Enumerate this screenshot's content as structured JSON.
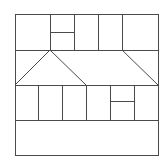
{
  "diagram": {
    "title": "",
    "stroke_color": "#4a4a4a",
    "background": "#ffffff",
    "outer_box": {
      "x": 15,
      "y": 14,
      "width": 143,
      "height": 141
    },
    "horizontal_lines": [
      {
        "x1": 15,
        "y1": 50,
        "x2": 158,
        "y2": 50
      },
      {
        "x1": 15,
        "y1": 85,
        "x2": 158,
        "y2": 85
      },
      {
        "x1": 15,
        "y1": 120,
        "x2": 158,
        "y2": 120
      },
      {
        "x1": 50,
        "y1": 32,
        "x2": 74,
        "y2": 32
      },
      {
        "x1": 110,
        "y1": 101,
        "x2": 134,
        "y2": 101
      }
    ],
    "vertical_lines": [
      {
        "x1": 50,
        "y1": 14,
        "x2": 50,
        "y2": 50
      },
      {
        "x1": 74,
        "y1": 14,
        "x2": 74,
        "y2": 50
      },
      {
        "x1": 98,
        "y1": 14,
        "x2": 98,
        "y2": 50
      },
      {
        "x1": 122,
        "y1": 14,
        "x2": 122,
        "y2": 50
      },
      {
        "x1": 38,
        "y1": 85,
        "x2": 38,
        "y2": 120
      },
      {
        "x1": 62,
        "y1": 85,
        "x2": 62,
        "y2": 120
      },
      {
        "x1": 86,
        "y1": 85,
        "x2": 86,
        "y2": 120
      },
      {
        "x1": 110,
        "y1": 85,
        "x2": 110,
        "y2": 120
      },
      {
        "x1": 134,
        "y1": 85,
        "x2": 134,
        "y2": 120
      }
    ],
    "diagonal_lines": [
      {
        "x1": 50,
        "y1": 50,
        "x2": 15,
        "y2": 85
      },
      {
        "x1": 50,
        "y1": 50,
        "x2": 86,
        "y2": 85
      },
      {
        "x1": 122,
        "y1": 50,
        "x2": 158,
        "y2": 85
      }
    ]
  }
}
